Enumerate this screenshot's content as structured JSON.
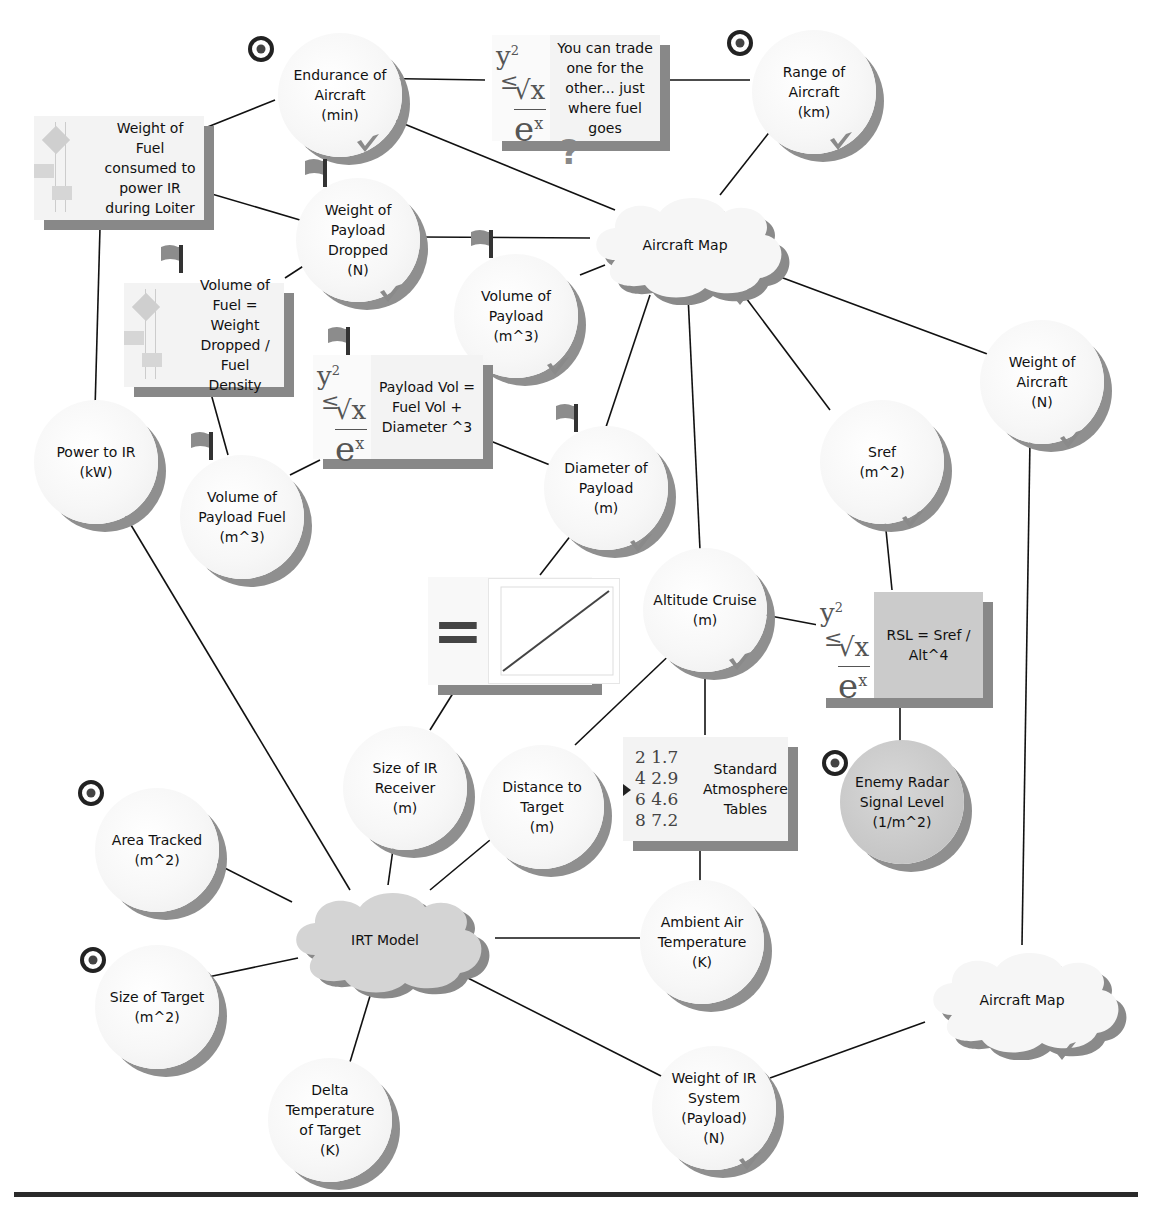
{
  "diagram": {
    "type": "concept-map",
    "nodes": {
      "endurance": {
        "label": "Endurance of\nAircraft\n(min)",
        "shape": "circle",
        "marker": "target",
        "status": "check"
      },
      "tradeoff_note": {
        "label": "You can trade\none for the\nother... just\nwhere fuel\ngoes",
        "shape": "equation-box",
        "marker": "question"
      },
      "range": {
        "label": "Range of\nAircraft\n(km)",
        "shape": "circle",
        "marker": "target",
        "status": "check"
      },
      "fuel_weight": {
        "label": "Weight of Fuel\nconsumed to\npower IR\nduring Loiter",
        "shape": "flowchart-box"
      },
      "payload_dropped": {
        "label": "Weight of\nPayload\nDropped\n(N)",
        "shape": "circle",
        "marker": "flag",
        "status": "check"
      },
      "aircraft_map_top": {
        "label": "Aircraft Map",
        "shape": "cloud",
        "status": "check"
      },
      "fuel_volume_eq": {
        "label": "Volume of\nFuel = Weight\nDropped / Fuel\nDensity",
        "shape": "flowchart-box",
        "marker": "flag"
      },
      "payload_volume": {
        "label": "Volume of\nPayload\n(m^3)",
        "shape": "circle",
        "marker": "flag",
        "status": "check"
      },
      "payload_vol_eq": {
        "label": "Payload Vol =\nFuel Vol +\nDiameter ^3",
        "shape": "equation-box",
        "marker": "flag"
      },
      "aircraft_weight": {
        "label": "Weight of\nAircraft\n(N)",
        "shape": "circle",
        "status": "check"
      },
      "power_ir": {
        "label": "Power to IR\n(kW)",
        "shape": "circle"
      },
      "payload_fuel_volume": {
        "label": "Volume of\nPayload Fuel\n(m^3)",
        "shape": "circle",
        "marker": "flag"
      },
      "payload_diameter": {
        "label": "Diameter of\nPayload\n(m)",
        "shape": "circle",
        "marker": "flag",
        "status": "check"
      },
      "sref": {
        "label": "Sref\n(m^2)",
        "shape": "circle",
        "status": "check"
      },
      "plot_box": {
        "label": "=",
        "shape": "plot-box",
        "plot_series_label": "Payload Diameter vs Receiver Size"
      },
      "altitude": {
        "label": "Altitude Cruise\n(m)",
        "shape": "circle",
        "status": "check"
      },
      "rsl_eq": {
        "label": "RSL = Sref /\nAlt^4",
        "shape": "equation-box-grey"
      },
      "ir_receiver": {
        "label": "Size of IR\nReceiver\n(m)",
        "shape": "circle"
      },
      "distance_target": {
        "label": "Distance to\nTarget\n(m)",
        "shape": "circle"
      },
      "std_atmosphere": {
        "label": "Standard\nAtmosphere\nTables",
        "shape": "table-box",
        "table_icon": [
          [
            "2",
            "1.7"
          ],
          [
            "4",
            "2.9"
          ],
          [
            "6",
            "4.6"
          ],
          [
            "8",
            "7.2"
          ]
        ]
      },
      "enemy_radar": {
        "label": "Enemy Radar\nSignal Level\n(1/m^2)",
        "shape": "circle-dark",
        "marker": "target"
      },
      "area_tracked": {
        "label": "Area Tracked\n(m^2)",
        "shape": "circle",
        "marker": "target"
      },
      "irt_model": {
        "label": "IRT Model",
        "shape": "cloud-grey"
      },
      "ambient_temp": {
        "label": "Ambient Air\nTemperature\n(K)",
        "shape": "circle"
      },
      "aircraft_map_bottom": {
        "label": "Aircraft Map",
        "shape": "cloud",
        "status": "check"
      },
      "target_size": {
        "label": "Size of Target\n(m^2)",
        "shape": "circle",
        "marker": "target"
      },
      "delta_temp": {
        "label": "Delta\nTemperature\nof Target\n(K)",
        "shape": "circle"
      },
      "ir_weight": {
        "label": "Weight of IR\nSystem\n(Payload)\n(N)",
        "shape": "circle",
        "status": "check"
      }
    },
    "eq_glyph": {
      "y": "y",
      "sup2": "2",
      "le": "≤",
      "sqrt": "√x",
      "e": "e",
      "supx": "x"
    },
    "question_mark": "?",
    "edges": [
      [
        "endurance",
        "tradeoff_note"
      ],
      [
        "tradeoff_note",
        "range"
      ],
      [
        "endurance",
        "fuel_weight"
      ],
      [
        "endurance",
        "aircraft_map_top"
      ],
      [
        "range",
        "aircraft_map_top"
      ],
      [
        "fuel_weight",
        "payload_dropped"
      ],
      [
        "fuel_weight",
        "power_ir"
      ],
      [
        "payload_dropped",
        "aircraft_map_top"
      ],
      [
        "payload_dropped",
        "fuel_volume_eq"
      ],
      [
        "payload_volume",
        "aircraft_map_top"
      ],
      [
        "payload_volume",
        "payload_vol_eq"
      ],
      [
        "fuel_volume_eq",
        "payload_fuel_volume"
      ],
      [
        "payload_vol_eq",
        "payload_fuel_volume"
      ],
      [
        "payload_vol_eq",
        "payload_diameter"
      ],
      [
        "aircraft_map_top",
        "payload_diameter"
      ],
      [
        "aircraft_map_top",
        "altitude"
      ],
      [
        "aircraft_map_top",
        "sref"
      ],
      [
        "aircraft_map_top",
        "aircraft_weight"
      ],
      [
        "payload_diameter",
        "plot_box"
      ],
      [
        "plot_box",
        "ir_receiver"
      ],
      [
        "altitude",
        "rsl_eq"
      ],
      [
        "sref",
        "rsl_eq"
      ],
      [
        "rsl_eq",
        "enemy_radar"
      ],
      [
        "altitude",
        "distance_target"
      ],
      [
        "altitude",
        "std_atmosphere"
      ],
      [
        "std_atmosphere",
        "ambient_temp"
      ],
      [
        "aircraft_weight",
        "aircraft_map_bottom"
      ],
      [
        "power_ir",
        "irt_model"
      ],
      [
        "ir_receiver",
        "irt_model"
      ],
      [
        "distance_target",
        "irt_model"
      ],
      [
        "area_tracked",
        "irt_model"
      ],
      [
        "target_size",
        "irt_model"
      ],
      [
        "delta_temp",
        "irt_model"
      ],
      [
        "irt_model",
        "ambient_temp"
      ],
      [
        "irt_model",
        "ir_weight"
      ],
      [
        "ir_weight",
        "aircraft_map_bottom"
      ]
    ]
  }
}
